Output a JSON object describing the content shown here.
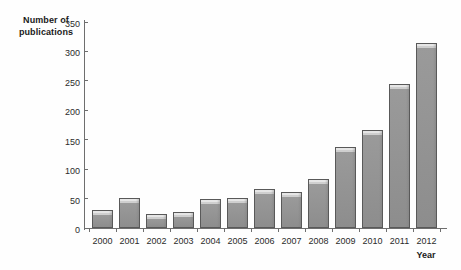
{
  "chart_data": {
    "type": "bar",
    "title": "",
    "xlabel": "Year",
    "ylabel": "Number of publications",
    "categories": [
      "2000",
      "2001",
      "2002",
      "2003",
      "2004",
      "2005",
      "2006",
      "2007",
      "2008",
      "2009",
      "2010",
      "2011",
      "2012"
    ],
    "values": [
      31,
      51,
      23,
      27,
      50,
      51,
      66,
      61,
      83,
      137,
      166,
      245,
      315
    ],
    "ylim": [
      0,
      350
    ],
    "ytick_labels": [
      "0",
      "50",
      "100",
      "150",
      "200",
      "250",
      "300",
      "350"
    ],
    "ytick_values": [
      0,
      50,
      100,
      150,
      200,
      250,
      300,
      350
    ],
    "grid": false,
    "legend": false,
    "series": [
      {
        "name": "Number of publications",
        "values": [
          31,
          51,
          23,
          27,
          50,
          51,
          66,
          61,
          83,
          137,
          166,
          245,
          315
        ]
      }
    ],
    "colors": {
      "bar_fill": "#8d8d8d",
      "bar_highlight": "#e6e6e6",
      "bar_border": "#595959",
      "axis": "#6e6e6e",
      "text": "#1a1a1a",
      "background": "#fefefe"
    }
  },
  "axis": {
    "y_title_line1": "Number of",
    "y_title_line2": "publications",
    "x_title": "Year"
  }
}
